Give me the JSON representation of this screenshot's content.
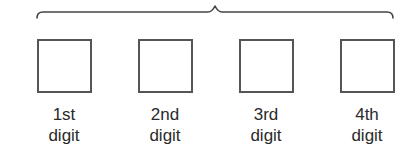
{
  "diagram": {
    "brace": {
      "orientation": "horizontal-over",
      "spans": "all-digits",
      "color": "#444444"
    },
    "slots": [
      {
        "ordinal": "1st",
        "word": "digit",
        "value": ""
      },
      {
        "ordinal": "2nd",
        "word": "digit",
        "value": ""
      },
      {
        "ordinal": "3rd",
        "word": "digit",
        "value": ""
      },
      {
        "ordinal": "4th",
        "word": "digit",
        "value": ""
      }
    ],
    "slot_border_color": "#555555",
    "text_color": "#2a2a2a"
  }
}
